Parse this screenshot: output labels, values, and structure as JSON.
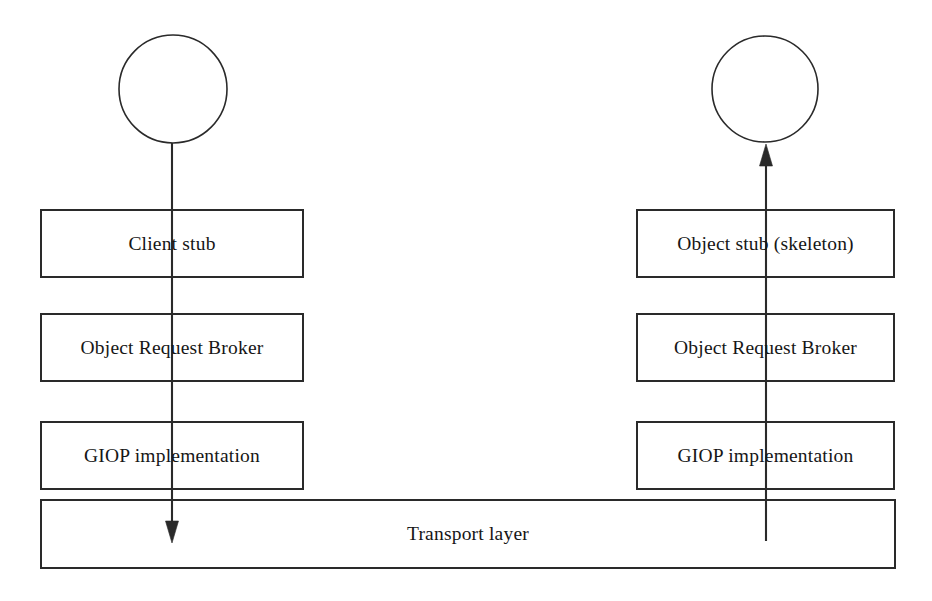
{
  "diagram": {
    "background_color": "#ffffff",
    "stroke_color": "#2a2a2a",
    "text_color": "#161616",
    "client_side": {
      "actor_name": "client-actor",
      "boxes": [
        {
          "id": "client-stub",
          "label": "Client stub"
        },
        {
          "id": "client-orb",
          "label": "Object Request Broker"
        },
        {
          "id": "client-giop",
          "label": "GIOP implementation"
        }
      ]
    },
    "server_side": {
      "actor_name": "object-actor",
      "boxes": [
        {
          "id": "object-skeleton",
          "label": "Object stub (skeleton)"
        },
        {
          "id": "server-orb",
          "label": "Object Request Broker"
        },
        {
          "id": "server-giop",
          "label": "GIOP implementation"
        }
      ]
    },
    "shared": {
      "transport_label": "Transport layer"
    },
    "flows": [
      {
        "id": "request-down",
        "direction": "down",
        "side": "client"
      },
      {
        "id": "reply-up",
        "direction": "up",
        "side": "server"
      }
    ]
  },
  "geometry": {
    "client_column": {
      "x": 41,
      "width": 262
    },
    "server_column": {
      "x": 637,
      "width": 257
    },
    "rows": [
      {
        "y": 210,
        "height": 67
      },
      {
        "y": 314,
        "height": 67
      },
      {
        "y": 422,
        "height": 67
      }
    ],
    "transport": {
      "x": 41,
      "y": 500,
      "width": 854,
      "height": 68
    },
    "client_circle": {
      "cx": 173,
      "cy": 89,
      "r": 54
    },
    "server_circle": {
      "cx": 765,
      "cy": 89,
      "r": 53
    },
    "client_line": {
      "x": 172,
      "y1": 143,
      "y2": 541
    },
    "server_line": {
      "x": 766,
      "y1": 541,
      "y2": 145
    }
  }
}
